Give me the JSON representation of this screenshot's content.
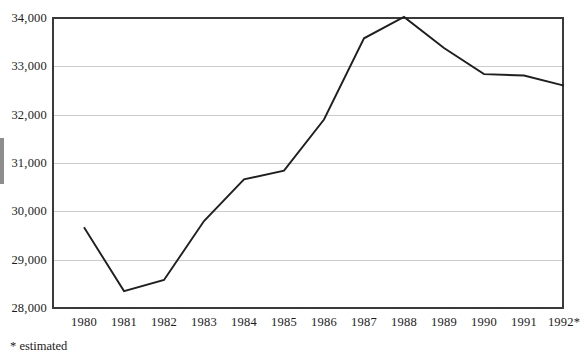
{
  "chart_data": {
    "type": "line",
    "title": "",
    "subtitle": "",
    "xlabel": "",
    "ylabel": "",
    "categories": [
      "1980",
      "1981",
      "1982",
      "1983",
      "1984",
      "1985",
      "1986",
      "1987",
      "1988",
      "1989",
      "1990",
      "1991",
      "1992*"
    ],
    "values": [
      29670,
      28350,
      28580,
      29800,
      30660,
      30840,
      31900,
      33580,
      34020,
      33380,
      32840,
      32810,
      32600
    ],
    "series": [
      {
        "name": "",
        "values": [
          29670,
          28350,
          28580,
          29800,
          30660,
          30840,
          31900,
          33580,
          34020,
          33380,
          32840,
          32810,
          32600
        ]
      }
    ],
    "ylim": [
      28000,
      34000
    ],
    "yticks": [
      28000,
      29000,
      30000,
      31000,
      32000,
      33000,
      34000
    ],
    "ytick_labels": [
      "28,000",
      "29,000",
      "30,000",
      "31,000",
      "32,000",
      "33,000",
      "34,000"
    ],
    "xtick_labels": [
      "1980",
      "1981",
      "1982",
      "1983",
      "1984",
      "1985",
      "1986",
      "1987",
      "1988",
      "1989",
      "1990",
      "1991",
      "1992*"
    ],
    "grid": true,
    "grid_axis": "y",
    "legend": false,
    "legend_position": "none",
    "annotations": [
      "* estimated"
    ],
    "line_color": "#1f1f1f",
    "grid_color": "#cccccc",
    "axis_color": "#3a3a3a",
    "background_color": "#ffffff"
  },
  "figure": {
    "footnote": "* estimated"
  }
}
